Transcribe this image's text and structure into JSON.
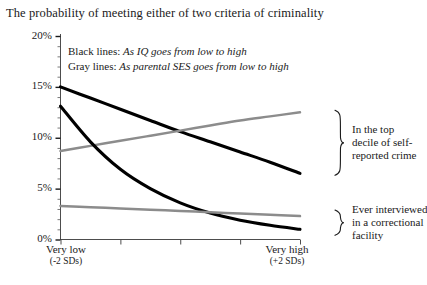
{
  "chart_data": {
    "type": "line",
    "title": "The probability of meeting either of two criteria of criminality",
    "xlabel": "",
    "ylabel": "",
    "ylim": [
      0,
      20
    ],
    "yticks": [
      "0%",
      "5%",
      "10%",
      "15%",
      "20%"
    ],
    "ytick_values": [
      0,
      5,
      10,
      15,
      20
    ],
    "xlim": [
      -2,
      2
    ],
    "xticks": [
      -2,
      -1,
      0,
      1,
      2
    ],
    "x_axis_left_label": "Very low",
    "x_axis_left_sublabel": "(-2 SDs)",
    "x_axis_right_label": "Very high",
    "x_axis_right_sublabel": "(+2 SDs)",
    "grid": false,
    "legend_position": "inside-top",
    "x": [
      -2,
      -1.5,
      -1,
      -0.5,
      0,
      0.5,
      1,
      1.5,
      2
    ],
    "series": [
      {
        "name": "IQ, top decile of self-reported crime",
        "color": "#000000",
        "style": "black",
        "group": "top-decile",
        "values": [
          15.0,
          13.9,
          12.8,
          11.7,
          10.6,
          9.6,
          8.6,
          7.6,
          6.5
        ]
      },
      {
        "name": "Parental SES, top decile of self-reported crime",
        "color": "#8c8c8c",
        "style": "gray",
        "group": "top-decile",
        "values": [
          8.7,
          9.2,
          9.7,
          10.2,
          10.7,
          11.2,
          11.7,
          12.1,
          12.5
        ]
      },
      {
        "name": "IQ, ever interviewed in a correctional facility",
        "color": "#000000",
        "style": "black",
        "group": "correctional",
        "values": [
          13.1,
          9.6,
          6.9,
          5.0,
          3.6,
          2.6,
          1.9,
          1.4,
          1.0
        ]
      },
      {
        "name": "Parental SES, ever interviewed in a correctional facility",
        "color": "#8c8c8c",
        "style": "gray",
        "group": "correctional",
        "values": [
          3.3,
          3.18,
          3.05,
          2.93,
          2.8,
          2.68,
          2.55,
          2.43,
          2.3
        ]
      }
    ],
    "annotations": [
      {
        "id": "top-decile",
        "text": "In the top decile of self-reported crime"
      },
      {
        "id": "correctional",
        "text": "Ever interviewed in a correctional facility"
      }
    ]
  },
  "legend": {
    "line1_lead": "Black lines:",
    "line1_desc": "As IQ goes from low to high",
    "line2_lead": "Gray lines:",
    "line2_desc": "As parental SES goes from low to high"
  },
  "annotations": {
    "top": {
      "line1": "In the top",
      "line2": "decile of self-",
      "line3": "reported crime"
    },
    "bottom": {
      "line1": "Ever interviewed",
      "line2": "in a correctional",
      "line3": "facility"
    }
  },
  "yticks": {
    "t0": "0%",
    "t5": "5%",
    "t10": "10%",
    "t15": "15%",
    "t20": "20%"
  },
  "xaxis": {
    "left_label": "Very low",
    "left_sub": "(-2 SDs)",
    "right_label": "Very high",
    "right_sub": "(+2 SDs)"
  },
  "colors": {
    "black_line": "#000000",
    "gray_line": "#8c8c8c",
    "axis": "#4d4d4d",
    "text": "#1a1a1a"
  }
}
